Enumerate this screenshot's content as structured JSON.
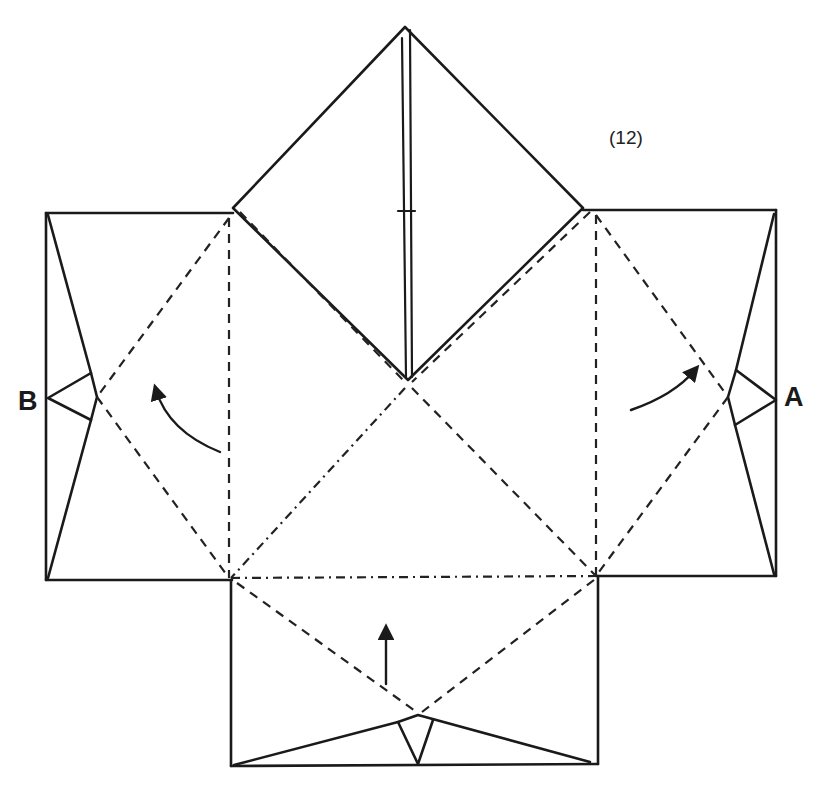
{
  "diagram": {
    "type": "origami-folding-step",
    "step_number": "(12)",
    "point_labels": {
      "left": "B",
      "right": "A"
    },
    "line_legend": {
      "solid": "existing edges / creases",
      "dashed": "valley fold lines",
      "dash_dot": "mountain fold lines"
    },
    "arrows": [
      {
        "name": "fold-arrow-left",
        "direction": "up-left"
      },
      {
        "name": "fold-arrow-right",
        "direction": "up-right"
      },
      {
        "name": "fold-arrow-bottom",
        "direction": "up"
      }
    ],
    "colors": {
      "ink": "#1a1a1a",
      "paper": "#ffffff"
    }
  }
}
